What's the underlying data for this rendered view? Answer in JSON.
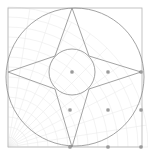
{
  "document": {
    "title": "Geometric Construction",
    "canvas_width": 148,
    "canvas_height": 154,
    "background_color": "#ffffff"
  },
  "palette": {
    "stroke_primary": "#8c8c8c",
    "stroke_frame": "#b4b4b4",
    "stroke_faint": "#e3e3e3",
    "stroke_very_faint": "#eeeeee",
    "point_fill": "#9a9a9a",
    "point_stroke": "#7a7a7a"
  },
  "frame": {
    "name": "bounding-square",
    "x": 8,
    "y": 8,
    "width": 134,
    "height": 139,
    "stroke": "#b4b4b4",
    "stroke_width": 0.8
  },
  "shapes": {
    "outer_circle": {
      "label": "Large circumscribed circle",
      "cx": 75,
      "cy": 77,
      "r": 69,
      "stroke": "#8c8c8c",
      "stroke_width": 0.8
    },
    "inner_circle": {
      "label": "Central incircle",
      "cx": 72,
      "cy": 72,
      "r": 23,
      "stroke": "#8c8c8c",
      "stroke_width": 0.8
    },
    "star": {
      "label": "Four pointed star",
      "stroke": "#8c8c8c",
      "stroke_width": 0.8,
      "points": [
        {
          "name": "top-vertex",
          "x": 72,
          "y": 8
        },
        {
          "name": "upper-right-notch",
          "x": 89,
          "y": 56
        },
        {
          "name": "right-vertex",
          "x": 141,
          "y": 72
        },
        {
          "name": "lower-right-notch",
          "x": 89,
          "y": 89
        },
        {
          "name": "bottom-vertex",
          "x": 72,
          "y": 147
        },
        {
          "name": "lower-left-notch",
          "x": 55,
          "y": 89
        },
        {
          "name": "left-vertex",
          "x": 8,
          "y": 72
        },
        {
          "name": "upper-left-notch",
          "x": 55,
          "y": 56
        }
      ]
    }
  },
  "web": {
    "label": "Faint radial web pattern",
    "origin_x": 8,
    "origin_y": 147,
    "radial_count": 11,
    "arc_count": 14,
    "arc_step": 10,
    "stroke": "#e9e9e9",
    "stroke_width": 0.55,
    "angle_start": 0,
    "angle_end": 90
  },
  "control_points": {
    "label": "Control point markers",
    "size": 2.4,
    "fill": "#9a9a9a",
    "stroke": "#7a7a7a",
    "items": [
      {
        "name": "point-center",
        "x": 72,
        "y": 72
      },
      {
        "name": "point-mid-right",
        "x": 108,
        "y": 72
      },
      {
        "name": "point-lower-left",
        "x": 70,
        "y": 110
      },
      {
        "name": "point-lower-right",
        "x": 108,
        "y": 110
      },
      {
        "name": "point-edge-right-upper",
        "x": 141,
        "y": 72
      },
      {
        "name": "point-edge-right-lower",
        "x": 141,
        "y": 110
      },
      {
        "name": "point-edge-bottom-left",
        "x": 70,
        "y": 147
      },
      {
        "name": "point-edge-bottom-mid",
        "x": 108,
        "y": 147
      },
      {
        "name": "point-edge-bottom-right",
        "x": 141,
        "y": 147
      }
    ]
  }
}
